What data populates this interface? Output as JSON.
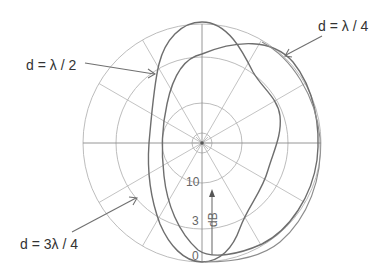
{
  "diagram": {
    "type": "polar-radiation-pattern",
    "center": {
      "x": 202,
      "y": 143
    },
    "scale": {
      "unit_label": "dB",
      "ring_labels": [
        "10",
        "3",
        "0"
      ],
      "rings_db": [
        10,
        3,
        0
      ]
    },
    "curves": [
      {
        "name": "d-lambda-half",
        "label": "d = λ / 2"
      },
      {
        "name": "d-lambda-quarter",
        "label": "d = λ / 4"
      },
      {
        "name": "d-three-lambda-quarter",
        "label": "d = 3λ / 4"
      }
    ],
    "colors": {
      "grid": "#b4b4b4",
      "curve": "#6e6e6e",
      "text": "#333333"
    }
  }
}
